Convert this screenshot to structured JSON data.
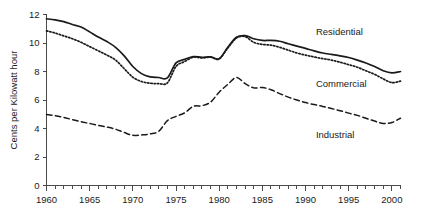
{
  "chart_data": {
    "type": "line",
    "title": "",
    "xlabel": "",
    "ylabel": "Cents per Kilowatt hour",
    "xlim": [
      1960,
      2001
    ],
    "ylim": [
      0,
      12
    ],
    "grid": false,
    "legend_position": "inline-right",
    "y_ticks": [
      0,
      2,
      4,
      6,
      8,
      10,
      12
    ],
    "y_tick_labels": [
      "0",
      "2",
      "4",
      "6",
      "8",
      "10",
      "12"
    ],
    "x_ticks": [
      1960,
      1965,
      1970,
      1975,
      1980,
      1985,
      1990,
      1995,
      2000
    ],
    "x_tick_labels": [
      "1960",
      "1965",
      "1970",
      "1975",
      "1980",
      "1985",
      "1990",
      "1995",
      "2000"
    ],
    "x_minor_tick_interval": 1,
    "x": [
      1960,
      1961,
      1962,
      1963,
      1964,
      1965,
      1966,
      1967,
      1968,
      1969,
      1970,
      1971,
      1972,
      1973,
      1974,
      1975,
      1976,
      1977,
      1978,
      1979,
      1980,
      1981,
      1982,
      1983,
      1984,
      1985,
      1986,
      1987,
      1988,
      1989,
      1990,
      1991,
      1992,
      1993,
      1994,
      1995,
      1996,
      1997,
      1998,
      1999,
      2000,
      2001
    ],
    "series": [
      {
        "name": "Residential",
        "style": "solid",
        "color": "#1a1a1a",
        "values": [
          11.7,
          11.62,
          11.5,
          11.3,
          11.12,
          10.78,
          10.42,
          10.1,
          9.7,
          9.1,
          8.35,
          7.85,
          7.62,
          7.58,
          7.55,
          8.6,
          8.85,
          9.05,
          9.0,
          9.02,
          8.9,
          9.7,
          10.4,
          10.52,
          10.3,
          10.18,
          10.18,
          10.12,
          9.95,
          9.78,
          9.62,
          9.45,
          9.3,
          9.2,
          9.1,
          8.98,
          8.8,
          8.6,
          8.35,
          8.05,
          7.9,
          8.0
        ]
      },
      {
        "name": "Commercial",
        "style": "dotted",
        "color": "#1a1a1a",
        "values": [
          10.85,
          10.7,
          10.5,
          10.3,
          10.05,
          9.75,
          9.45,
          9.15,
          8.8,
          8.2,
          7.6,
          7.3,
          7.18,
          7.15,
          7.2,
          8.35,
          8.7,
          9.0,
          8.95,
          9.0,
          8.88,
          9.65,
          10.35,
          10.45,
          10.05,
          9.9,
          9.85,
          9.7,
          9.5,
          9.3,
          9.15,
          9.02,
          8.9,
          8.8,
          8.65,
          8.48,
          8.3,
          8.05,
          7.8,
          7.48,
          7.22,
          7.32
        ]
      },
      {
        "name": "Industrial",
        "style": "dashed",
        "color": "#1a1a1a",
        "values": [
          4.98,
          4.9,
          4.78,
          4.62,
          4.48,
          4.35,
          4.22,
          4.1,
          3.95,
          3.72,
          3.52,
          3.55,
          3.62,
          3.8,
          4.55,
          4.85,
          5.1,
          5.55,
          5.6,
          5.85,
          6.55,
          7.1,
          7.58,
          7.15,
          6.85,
          6.88,
          6.72,
          6.45,
          6.2,
          6.0,
          5.82,
          5.68,
          5.55,
          5.4,
          5.25,
          5.08,
          4.92,
          4.72,
          4.52,
          4.35,
          4.42,
          4.72
        ]
      }
    ],
    "annotations": [
      {
        "text": "Residential",
        "x": 1991.2,
        "y": 10.55
      },
      {
        "text": "Commercial",
        "x": 1991.2,
        "y": 6.9
      },
      {
        "text": "Industrial",
        "x": 1991.2,
        "y": 3.35
      }
    ]
  }
}
